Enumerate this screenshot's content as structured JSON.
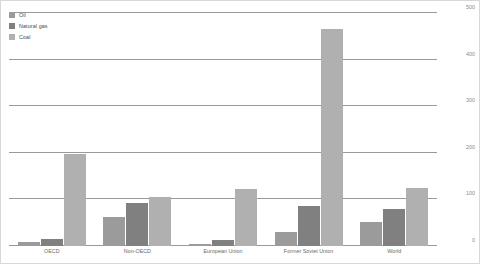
{
  "chart_data": {
    "type": "bar",
    "title": "",
    "subtitle": "",
    "xlabel": "",
    "ylabel": "",
    "ylim": [
      0,
      500
    ],
    "yticks": [
      0,
      100,
      200,
      300,
      400,
      500
    ],
    "grid": true,
    "legend_position": "top-left",
    "categories": [
      "OECD",
      "Non-OECD",
      "European Union",
      "Former Soviet Union",
      "World"
    ],
    "series": [
      {
        "name": "Oil",
        "color": "#9b9b9b",
        "values": [
          8,
          62,
          5,
          30,
          52
        ]
      },
      {
        "name": "Natural gas",
        "color": "#808080",
        "values": [
          14,
          92,
          12,
          85,
          80
        ]
      },
      {
        "name": "Coal",
        "color": "#b0b0b0",
        "values": [
          198,
          105,
          122,
          465,
          125
        ]
      }
    ]
  },
  "axis": {
    "y_tick_labels": [
      "500",
      "400",
      "300",
      "200",
      "100",
      "0"
    ]
  }
}
